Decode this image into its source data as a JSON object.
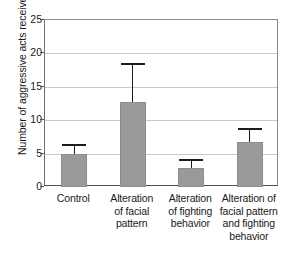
{
  "chart_data": {
    "type": "bar",
    "title": "",
    "subtitle": "",
    "xlabel": "",
    "ylabel": "Number of aggressive acts received",
    "ylim": [
      0,
      25
    ],
    "yticks": [
      0,
      5,
      10,
      15,
      20,
      25
    ],
    "ytick_labels": [
      "0",
      "5",
      "10",
      "15",
      "20",
      "25"
    ],
    "grid": true,
    "grid_axis": "y",
    "legend": false,
    "legend_position": "none",
    "error_bars": "upper-only",
    "categories": [
      "Control",
      "Alteration of facial pattern",
      "Alteration of fighting behavior",
      "Alteration of facial pattern and fighting behavior"
    ],
    "category_lines": [
      [
        "Control"
      ],
      [
        "Alteration",
        "of facial",
        "pattern"
      ],
      [
        "Alteration",
        "of fighting",
        "behavior"
      ],
      [
        "Alteration of",
        "facial pattern",
        "and fighting",
        "behavior"
      ]
    ],
    "values": [
      4.9,
      12.7,
      2.9,
      6.8
    ],
    "error_upper": [
      6.5,
      18.6,
      4.2,
      8.9
    ],
    "series": [
      {
        "name": "Number of aggressive acts received",
        "values": [
          4.9,
          12.7,
          2.9,
          6.8
        ],
        "error_upper": [
          6.5,
          18.6,
          4.2,
          8.9
        ],
        "color": "#9a9a9a"
      }
    ],
    "colors": {
      "bar_fill": "#9a9a9a",
      "bar_edge": "#8d8d8d",
      "error_bar": "#1c1c1c",
      "gridline": "#c9c9c9",
      "axis": "#4d4d4d",
      "text": "#1a1a1a",
      "background": "#ffffff"
    }
  }
}
